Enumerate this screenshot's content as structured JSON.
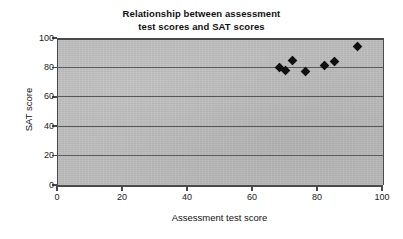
{
  "chart_data": {
    "type": "scatter",
    "title": "Relationship between assessment test scores and SAT scores",
    "title_lines": [
      "Relationship between assessment",
      "test scores and SAT scores"
    ],
    "xlabel": "Assessment test score",
    "ylabel": "SAT score",
    "xlim": [
      0,
      100
    ],
    "ylim": [
      0,
      100
    ],
    "xticks": [
      0,
      20,
      40,
      60,
      80,
      100
    ],
    "yticks": [
      0,
      20,
      40,
      60,
      80,
      100
    ],
    "xtick_labels": [
      "0",
      "20",
      "40",
      "60",
      "80",
      "100"
    ],
    "ytick_labels": [
      "0",
      "20",
      "40",
      "60",
      "80",
      "100"
    ],
    "grid": "horizontal",
    "legend": null,
    "marker": "diamond",
    "marker_color": "#101010",
    "plot_background": "#bdbdbd",
    "axis_color": "#4a4a4a",
    "gridline_color": "#585858",
    "points": [
      {
        "x": 68,
        "y": 80
      },
      {
        "x": 70,
        "y": 78
      },
      {
        "x": 72,
        "y": 85
      },
      {
        "x": 76,
        "y": 77
      },
      {
        "x": 82,
        "y": 81
      },
      {
        "x": 85,
        "y": 84
      },
      {
        "x": 92,
        "y": 94
      }
    ]
  }
}
